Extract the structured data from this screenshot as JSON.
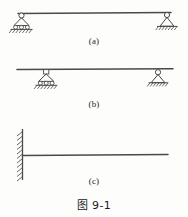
{
  "figure": {
    "caption": "图 9-1",
    "background_color": "#fdfdfc",
    "line_color": "#4a4a4a",
    "panels": [
      {
        "id": "a",
        "label": "(a)",
        "beam_type": "simply-supported-beam",
        "beam": {
          "x1": 18,
          "x2": 171,
          "y": 13
        },
        "supports": [
          {
            "name": "roller-support-left",
            "type": "roller",
            "x": 26,
            "y": 13,
            "placement": "below-beam-end"
          },
          {
            "name": "pin-support-right",
            "type": "pin",
            "x": 167,
            "y": 13,
            "placement": "below-beam-end"
          }
        ]
      },
      {
        "id": "b",
        "label": "(b)",
        "beam_type": "overhanging-beam",
        "beam": {
          "x1": 17,
          "x2": 173,
          "y": 69
        },
        "supports": [
          {
            "name": "roller-support-left",
            "type": "roller",
            "x": 46,
            "y": 69,
            "placement": "below-beam-interior"
          },
          {
            "name": "pin-support-right",
            "type": "pin",
            "x": 158,
            "y": 69,
            "placement": "below-beam-interior"
          }
        ]
      },
      {
        "id": "c",
        "label": "(c)",
        "beam_type": "cantilever-beam",
        "beam": {
          "x1": 22,
          "x2": 168,
          "y": 155
        },
        "supports": [
          {
            "name": "fixed-support-wall",
            "type": "fixed",
            "x": 22,
            "y_top": 130,
            "y_bottom": 180,
            "placement": "left-wall"
          }
        ]
      }
    ]
  }
}
